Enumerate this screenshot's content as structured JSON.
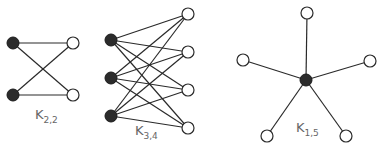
{
  "graphs": [
    {
      "name": "K2,2",
      "label": {
        "main": "K",
        "sub": "2,2",
        "x": 35,
        "y": 107
      },
      "left": [
        [
          13,
          43
        ],
        [
          13,
          95
        ]
      ],
      "right": [
        [
          73,
          43
        ],
        [
          73,
          95
        ]
      ]
    },
    {
      "name": "K3,4",
      "label": {
        "main": "K",
        "sub": "3,4",
        "x": 135,
        "y": 123
      },
      "left": [
        [
          111,
          40
        ],
        [
          111,
          78
        ],
        [
          111,
          116
        ]
      ],
      "right": [
        [
          188,
          14
        ],
        [
          188,
          52
        ],
        [
          188,
          90
        ],
        [
          188,
          128
        ]
      ]
    },
    {
      "name": "K1,5",
      "label": {
        "main": "K",
        "sub": "1,5",
        "x": 296,
        "y": 120
      },
      "left": [
        [
          306,
          80
        ]
      ],
      "right": [
        [
          307,
          13
        ],
        [
          243,
          60
        ],
        [
          370,
          61
        ],
        [
          267,
          136
        ],
        [
          346,
          136
        ]
      ]
    }
  ],
  "colors": {
    "filled": "#2b2b2b",
    "open": "#ffffff",
    "edge": "#2a2a2a",
    "label": "#666666"
  },
  "node_radius": 6
}
